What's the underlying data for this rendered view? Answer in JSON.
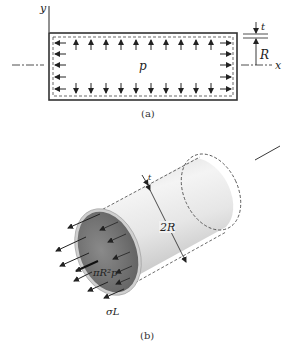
{
  "figure_a": {
    "caption": "(a)",
    "labels": {
      "y_axis": "y",
      "x_axis": "x",
      "pressure": "p",
      "thickness": "t",
      "radius": "R"
    }
  },
  "figure_b": {
    "caption": "(b)",
    "labels": {
      "thickness": "t",
      "diameter": "2R",
      "force": "πR²p",
      "longitudinal_stress": "σL"
    }
  },
  "colors": {
    "line": "#222222",
    "cylinder_light": "#eeeeee",
    "cylinder_shade": "#bdbdbd",
    "cylinder_end": "#7a7a7a"
  }
}
